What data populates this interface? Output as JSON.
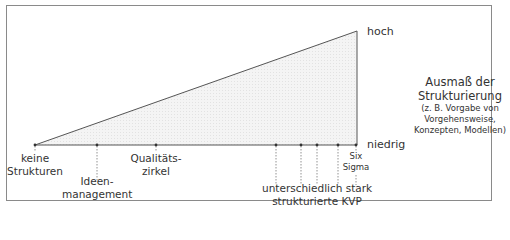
{
  "diagram": {
    "axis": {
      "high_label": "hoch",
      "low_label": "niedrig"
    },
    "legend": {
      "title_line1": "Ausmaß der",
      "title_line2": "Strukturierung",
      "note_line1": "(z. B. Vorgabe von",
      "note_line2": "Vorgehensweise,",
      "note_line3": "Konzepten, Modellen)"
    },
    "markers": [
      {
        "line1": "keine",
        "line2": "Strukturen"
      },
      {
        "line1": "Ideen-",
        "line2": "management"
      },
      {
        "line1": "Qualitäts-",
        "line2": "zirkel"
      },
      {
        "line1": "unterschiedlich stark",
        "line2": "strukturierte KVP"
      },
      {
        "line1": "Six",
        "line2": "Sigma"
      }
    ],
    "colors": {
      "frame": "#8a8a8a",
      "line": "#555555",
      "fill": "#efefef",
      "text": "#333333"
    }
  }
}
